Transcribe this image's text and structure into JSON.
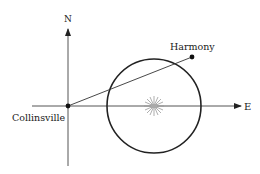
{
  "diagram": {
    "axes": {
      "north_label": "N",
      "east_label": "E"
    },
    "points": {
      "origin": {
        "label": "Collinsville"
      },
      "target": {
        "label": "Harmony"
      }
    },
    "circle": {
      "center_marker": "sunburst-icon"
    },
    "colors": {
      "line": "#333333",
      "circle": "#222222",
      "sun": "#9a9a9a"
    }
  }
}
